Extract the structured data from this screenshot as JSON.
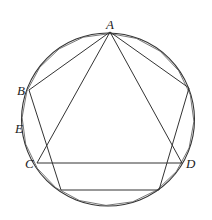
{
  "diagram": {
    "type": "geometry",
    "circle": {
      "cx": 108,
      "cy": 119.5,
      "r": 86.5
    },
    "colors": {
      "stroke": "#333333",
      "background": "#ffffff"
    },
    "points": {
      "A": {
        "x": 110,
        "y": 32
      },
      "B": {
        "x": 29,
        "y": 90
      },
      "C": {
        "x": 37,
        "y": 163
      },
      "D": {
        "x": 182,
        "y": 163
      },
      "R": {
        "x": 189,
        "y": 88
      },
      "P3": {
        "x": 159,
        "y": 190
      },
      "P4": {
        "x": 61,
        "y": 190
      }
    },
    "labels": [
      {
        "text": "A",
        "x": 106,
        "y": 29
      },
      {
        "text": "B",
        "x": 17,
        "y": 95
      },
      {
        "text": "E",
        "x": 15,
        "y": 133
      },
      {
        "text": "C",
        "x": 25,
        "y": 168
      },
      {
        "text": "D",
        "x": 186,
        "y": 168
      }
    ],
    "segments": [
      [
        "A",
        "B"
      ],
      [
        "A",
        "C"
      ],
      [
        "A",
        "D"
      ],
      [
        "A",
        "R"
      ],
      [
        "B",
        "P4"
      ],
      [
        "R",
        "P3"
      ],
      [
        "C",
        "D"
      ],
      [
        "P4",
        "P3"
      ]
    ]
  }
}
